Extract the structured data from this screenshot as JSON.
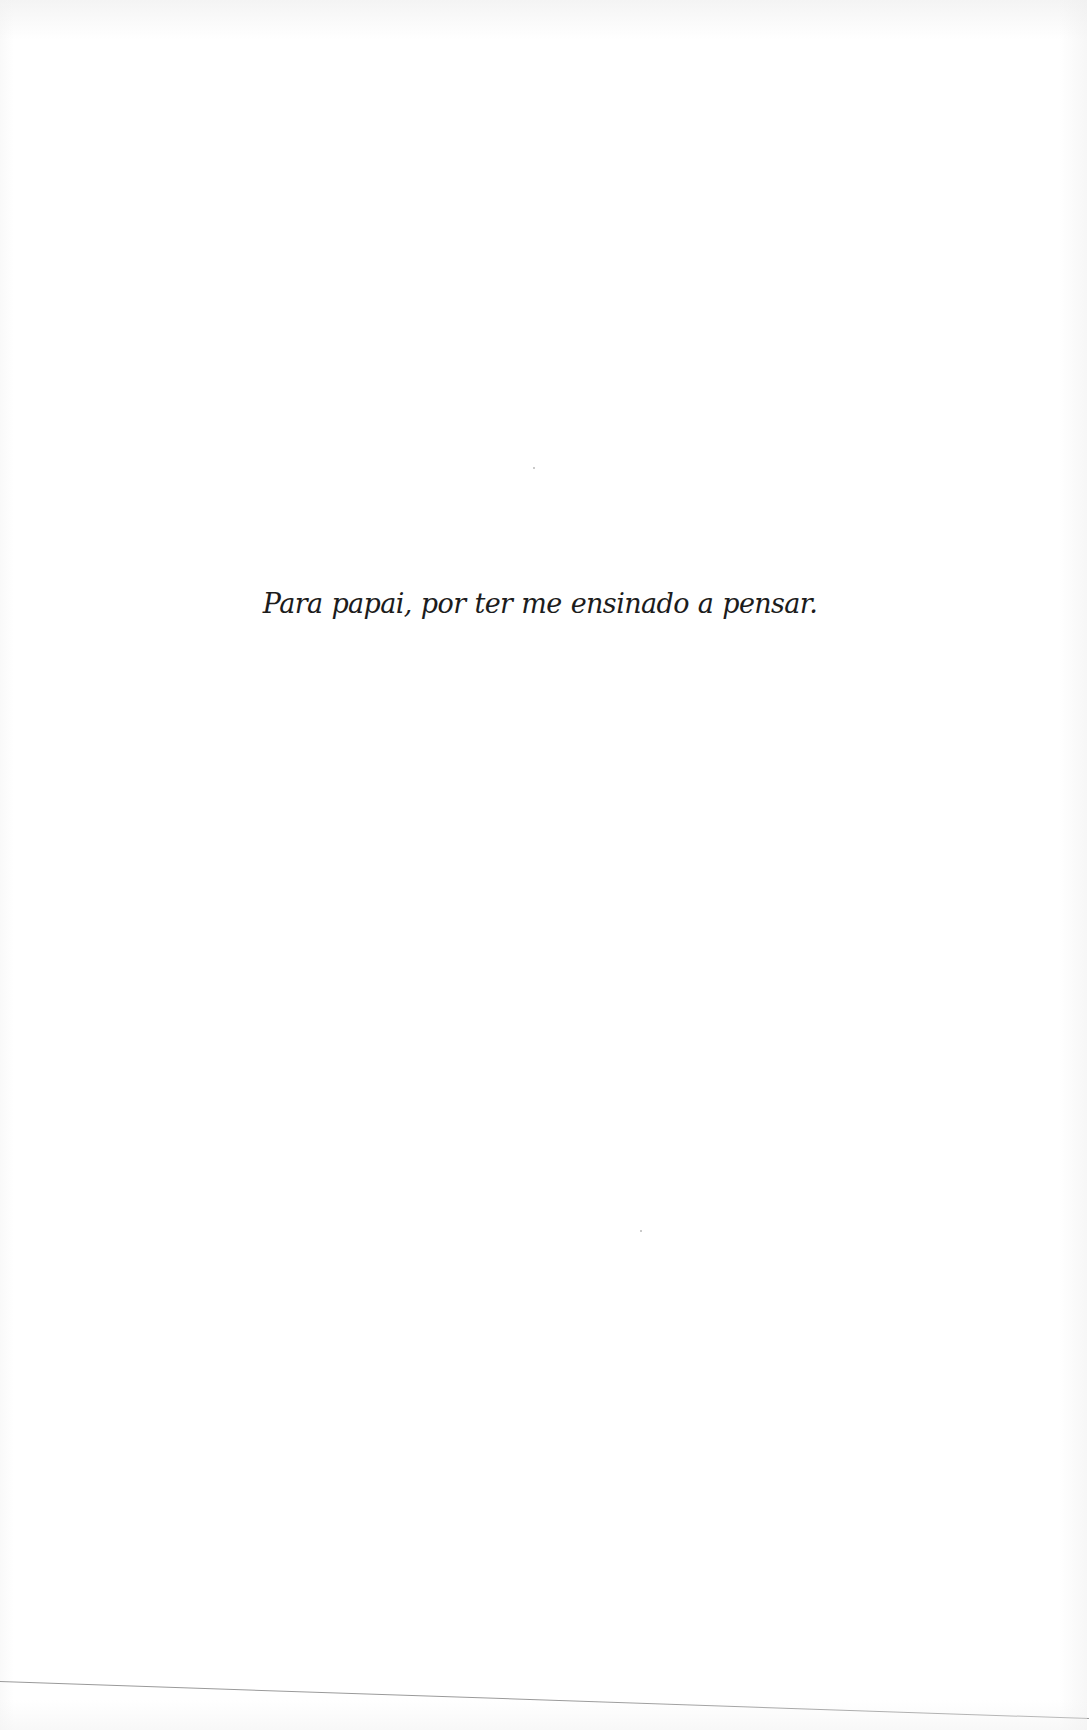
{
  "page": {
    "background_color": "#ffffff",
    "text_color": "#1c1c1c",
    "dedication": "Para papai, por ter me ensinado a pensar."
  }
}
